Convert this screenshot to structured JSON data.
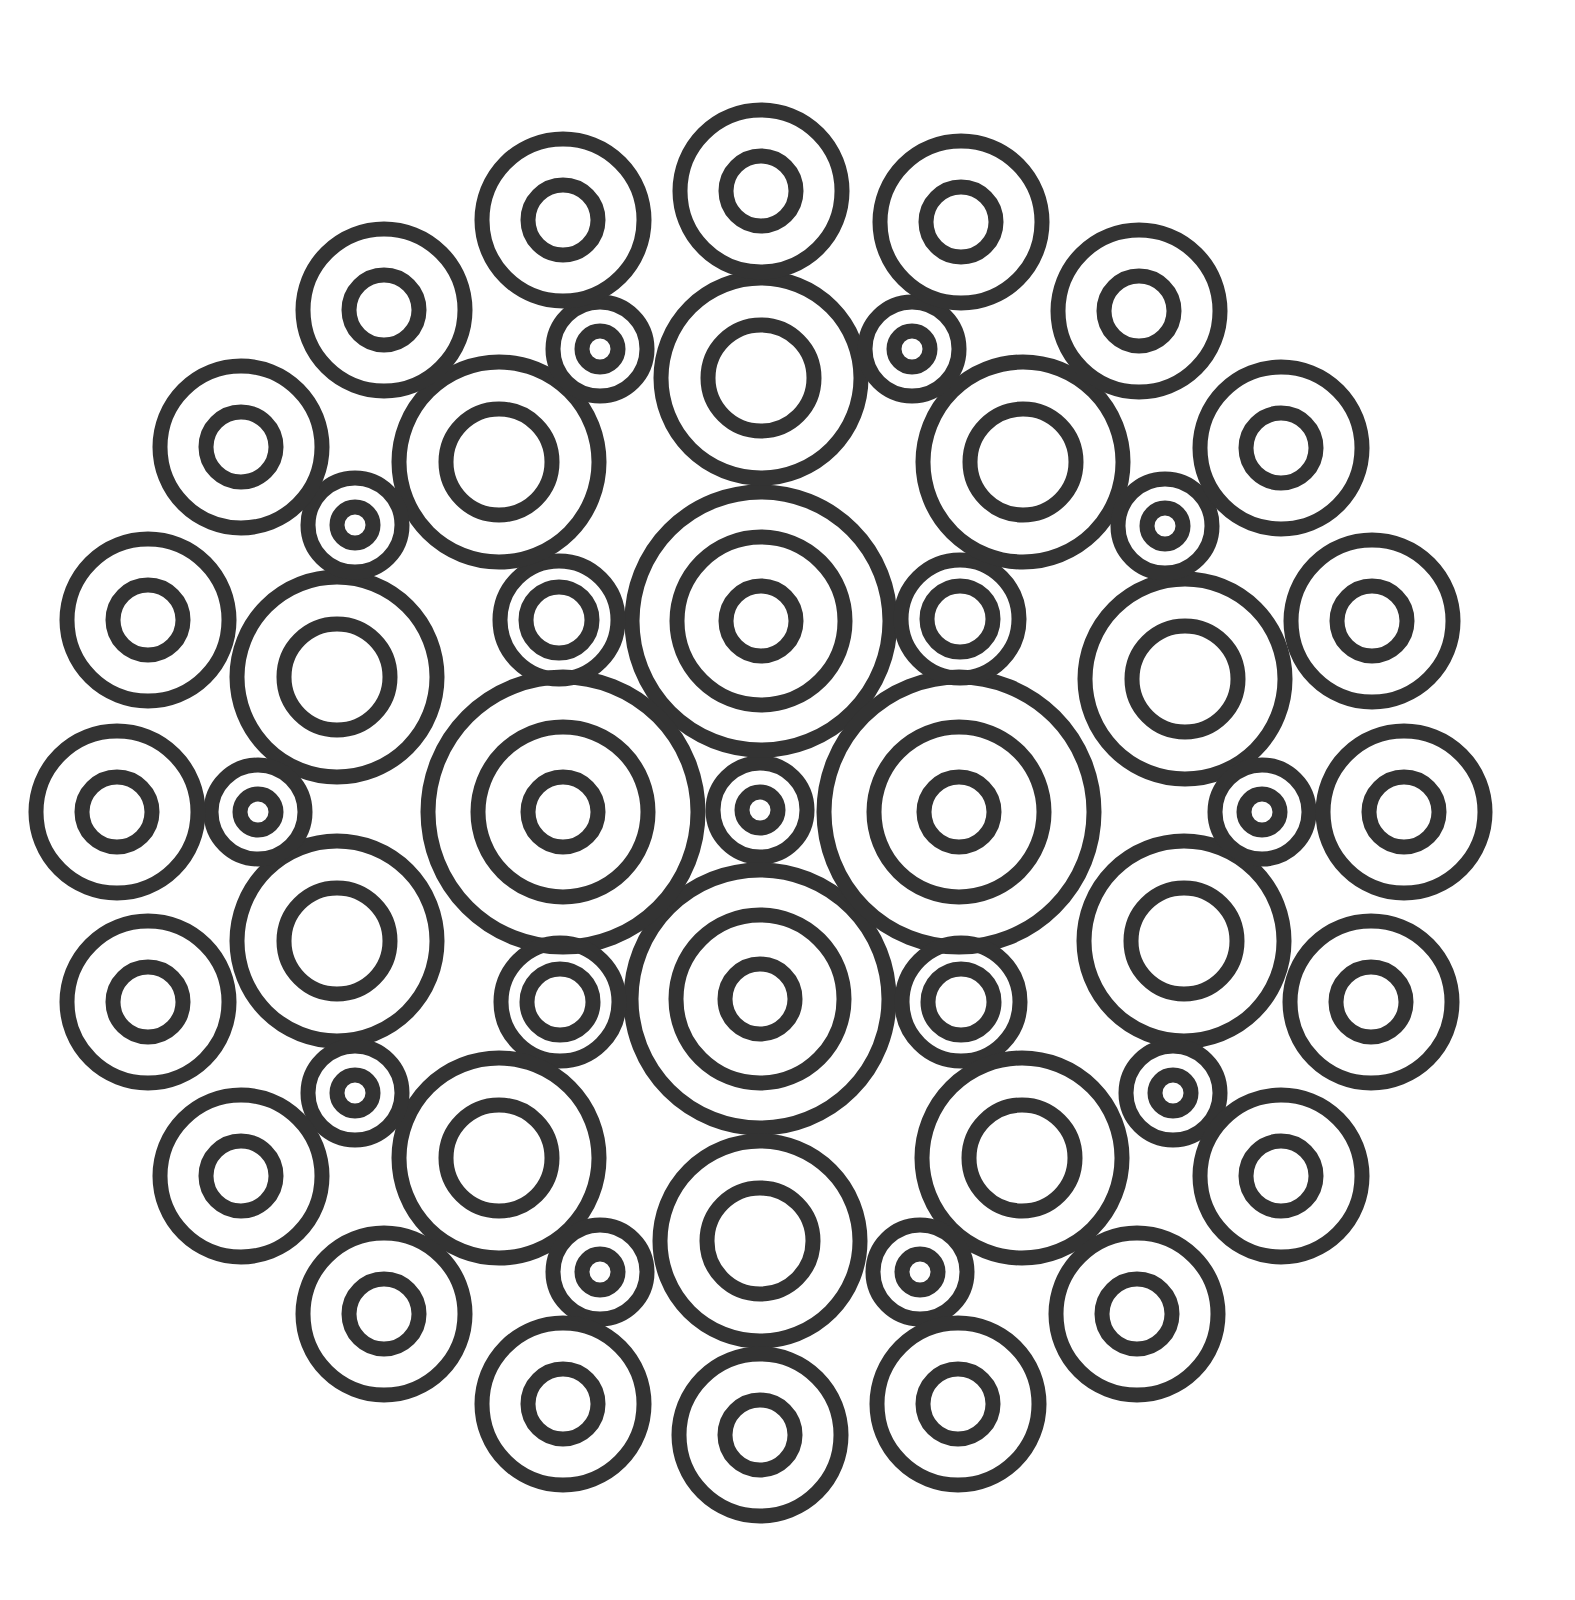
{
  "artwork": {
    "type": "mandala-line-art",
    "background": "#ffffff",
    "stroke_color": "#333333",
    "stroke_width": 15,
    "center": [
      760,
      810
    ]
  },
  "ring_sizes": {
    "small": [
      47,
      18
    ],
    "mid_small": [
      59,
      33
    ],
    "outer": [
      81,
      35
    ],
    "medium": [
      100,
      53
    ],
    "big_vertical": [
      129,
      84,
      35
    ],
    "big_horizontal": [
      135,
      85,
      35
    ]
  },
  "rings": [
    {
      "group": "center",
      "size": "small",
      "cx": 760,
      "cy": 810
    },
    {
      "group": "big",
      "size": "big_vertical",
      "cx": 761,
      "cy": 621
    },
    {
      "group": "big",
      "size": "big_vertical",
      "cx": 760,
      "cy": 999
    },
    {
      "group": "big",
      "size": "big_horizontal",
      "cx": 563,
      "cy": 812
    },
    {
      "group": "big",
      "size": "big_horizontal",
      "cx": 959,
      "cy": 812
    },
    {
      "group": "mid-small",
      "size": "mid_small",
      "cx": 559,
      "cy": 620
    },
    {
      "group": "mid-small",
      "size": "mid_small",
      "cx": 960,
      "cy": 619
    },
    {
      "group": "mid-small",
      "size": "mid_small",
      "cx": 560,
      "cy": 1002
    },
    {
      "group": "mid-small",
      "size": "mid_small",
      "cx": 961,
      "cy": 1002
    },
    {
      "group": "medium",
      "size": "medium",
      "cx": 761,
      "cy": 378
    },
    {
      "group": "medium",
      "size": "medium",
      "cx": 760,
      "cy": 1241
    },
    {
      "group": "medium",
      "size": "medium",
      "cx": 499,
      "cy": 462
    },
    {
      "group": "medium",
      "size": "medium",
      "cx": 1023,
      "cy": 462
    },
    {
      "group": "medium",
      "size": "medium",
      "cx": 499,
      "cy": 1158
    },
    {
      "group": "medium",
      "size": "medium",
      "cx": 1022,
      "cy": 1158
    },
    {
      "group": "medium",
      "size": "medium",
      "cx": 337,
      "cy": 677
    },
    {
      "group": "medium",
      "size": "medium",
      "cx": 1185,
      "cy": 679
    },
    {
      "group": "medium",
      "size": "medium",
      "cx": 337,
      "cy": 941
    },
    {
      "group": "medium",
      "size": "medium",
      "cx": 1184,
      "cy": 941
    },
    {
      "group": "small",
      "size": "small",
      "cx": 600,
      "cy": 349
    },
    {
      "group": "small",
      "size": "small",
      "cx": 912,
      "cy": 349
    },
    {
      "group": "small",
      "size": "small",
      "cx": 600,
      "cy": 1272
    },
    {
      "group": "small",
      "size": "small",
      "cx": 920,
      "cy": 1272
    },
    {
      "group": "small",
      "size": "small",
      "cx": 355,
      "cy": 525
    },
    {
      "group": "small",
      "size": "small",
      "cx": 1165,
      "cy": 526
    },
    {
      "group": "small",
      "size": "small",
      "cx": 355,
      "cy": 1093
    },
    {
      "group": "small",
      "size": "small",
      "cx": 1173,
      "cy": 1093
    },
    {
      "group": "small",
      "size": "small",
      "cx": 258,
      "cy": 812
    },
    {
      "group": "small",
      "size": "small",
      "cx": 1262,
      "cy": 812
    },
    {
      "group": "outer",
      "size": "outer",
      "cx": 761,
      "cy": 191
    },
    {
      "group": "outer",
      "size": "outer",
      "cx": 760,
      "cy": 1435
    },
    {
      "group": "outer",
      "size": "outer",
      "cx": 563,
      "cy": 220
    },
    {
      "group": "outer",
      "size": "outer",
      "cx": 961,
      "cy": 222
    },
    {
      "group": "outer",
      "size": "outer",
      "cx": 563,
      "cy": 1404
    },
    {
      "group": "outer",
      "size": "outer",
      "cx": 958,
      "cy": 1404
    },
    {
      "group": "outer",
      "size": "outer",
      "cx": 384,
      "cy": 310
    },
    {
      "group": "outer",
      "size": "outer",
      "cx": 1139,
      "cy": 311
    },
    {
      "group": "outer",
      "size": "outer",
      "cx": 384,
      "cy": 1314
    },
    {
      "group": "outer",
      "size": "outer",
      "cx": 1137,
      "cy": 1314
    },
    {
      "group": "outer",
      "size": "outer",
      "cx": 241,
      "cy": 447
    },
    {
      "group": "outer",
      "size": "outer",
      "cx": 1281,
      "cy": 448
    },
    {
      "group": "outer",
      "size": "outer",
      "cx": 241,
      "cy": 1176
    },
    {
      "group": "outer",
      "size": "outer",
      "cx": 1281,
      "cy": 1176
    },
    {
      "group": "outer",
      "size": "outer",
      "cx": 148,
      "cy": 620
    },
    {
      "group": "outer",
      "size": "outer",
      "cx": 1372,
      "cy": 621
    },
    {
      "group": "outer",
      "size": "outer",
      "cx": 148,
      "cy": 1002
    },
    {
      "group": "outer",
      "size": "outer",
      "cx": 1371,
      "cy": 1002
    },
    {
      "group": "outer",
      "size": "outer",
      "cx": 117,
      "cy": 812
    },
    {
      "group": "outer",
      "size": "outer",
      "cx": 1404,
      "cy": 812
    }
  ]
}
